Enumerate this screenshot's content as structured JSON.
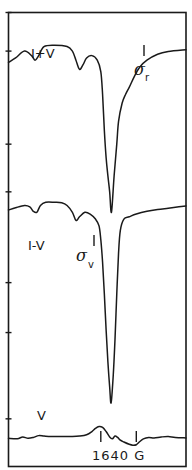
{
  "chart_data": {
    "type": "line",
    "title": "",
    "xlabel": "",
    "ylabel": "",
    "x_range": [
      0,
      100
    ],
    "y_range": [
      0,
      100
    ],
    "grid": false,
    "caption": "1640 G",
    "left_axis_ticks": [
      0,
      8.5,
      29,
      39.5,
      59.5,
      70.5,
      89.5
    ],
    "series": [
      {
        "name": "I+V",
        "label": "I+V",
        "annotation": {
          "symbol": "σ",
          "subscript": "r",
          "marker_x": 70
        },
        "points": [
          [
            0,
            11
          ],
          [
            4,
            10
          ],
          [
            9,
            8.5
          ],
          [
            13,
            9.5
          ],
          [
            15,
            10.5
          ],
          [
            17,
            9.5
          ],
          [
            20,
            7.5
          ],
          [
            26,
            7.2
          ],
          [
            33,
            7.5
          ],
          [
            36,
            8.5
          ],
          [
            38,
            10.5
          ],
          [
            40,
            12.5
          ],
          [
            42,
            11.5
          ],
          [
            44,
            10
          ],
          [
            47,
            9.5
          ],
          [
            50,
            10.5
          ],
          [
            52,
            13
          ],
          [
            53,
            18
          ],
          [
            54,
            26
          ],
          [
            55,
            32
          ],
          [
            56,
            36
          ],
          [
            57,
            39.5
          ],
          [
            58,
            44
          ],
          [
            59.5,
            36
          ],
          [
            61,
            29
          ],
          [
            62,
            24
          ],
          [
            64,
            20
          ],
          [
            66,
            18
          ],
          [
            68,
            16.5
          ],
          [
            71,
            14
          ],
          [
            74,
            12
          ],
          [
            78,
            10.5
          ],
          [
            84,
            9.2
          ],
          [
            90,
            8.6
          ],
          [
            100,
            8.2
          ]
        ]
      },
      {
        "name": "I-V",
        "label": "I-V",
        "annotation": {
          "symbol": "σ",
          "subscript": "v",
          "marker_x": 53
        },
        "points": [
          [
            0,
            43.5
          ],
          [
            4,
            43
          ],
          [
            9,
            42.5
          ],
          [
            12,
            42.8
          ],
          [
            14,
            43.8
          ],
          [
            16,
            44
          ],
          [
            18,
            42.5
          ],
          [
            21,
            41.8
          ],
          [
            26,
            41.8
          ],
          [
            30,
            41.9
          ],
          [
            33,
            42.5
          ],
          [
            36,
            44
          ],
          [
            38,
            45.8
          ],
          [
            40,
            45
          ],
          [
            43,
            44
          ],
          [
            46,
            44.4
          ],
          [
            49,
            45.5
          ],
          [
            51,
            47
          ],
          [
            52,
            50
          ],
          [
            53,
            55
          ],
          [
            54,
            62
          ],
          [
            55,
            70
          ],
          [
            56,
            77
          ],
          [
            57,
            82.5
          ],
          [
            57.8,
            86
          ],
          [
            59,
            80
          ],
          [
            60,
            72
          ],
          [
            61,
            62
          ],
          [
            62,
            53
          ],
          [
            63,
            48
          ],
          [
            65,
            45.5
          ],
          [
            68,
            45
          ],
          [
            72,
            44.4
          ],
          [
            78,
            43.8
          ],
          [
            84,
            43.4
          ],
          [
            90,
            43.1
          ],
          [
            96,
            42.8
          ],
          [
            100,
            42.6
          ]
        ]
      },
      {
        "name": "V",
        "label": "V",
        "annotation": {
          "bars_x": [
            52,
            72
          ]
        },
        "points": [
          [
            0,
            93.8
          ],
          [
            5,
            93.9
          ],
          [
            8,
            93.5
          ],
          [
            11,
            93.8
          ],
          [
            14,
            93.6
          ],
          [
            17,
            93.2
          ],
          [
            20,
            93.3
          ],
          [
            24,
            93.4
          ],
          [
            30,
            93.4
          ],
          [
            36,
            93.4
          ],
          [
            40,
            93.3
          ],
          [
            44,
            93.0
          ],
          [
            47,
            92.3
          ],
          [
            49,
            91.6
          ],
          [
            51,
            91.2
          ],
          [
            53,
            91.4
          ],
          [
            55,
            92.3
          ],
          [
            57,
            93.5
          ],
          [
            58.5,
            93.9
          ],
          [
            60,
            93.3
          ],
          [
            61.5,
            93.6
          ],
          [
            63,
            94.2
          ],
          [
            65,
            94.6
          ],
          [
            68,
            95.1
          ],
          [
            70,
            95.3
          ],
          [
            72,
            95.2
          ],
          [
            74,
            94.5
          ],
          [
            76,
            93.9
          ],
          [
            79,
            93.6
          ],
          [
            82,
            93.7
          ],
          [
            86,
            93.5
          ],
          [
            90,
            93.4
          ],
          [
            94,
            93.6
          ],
          [
            100,
            93.7
          ]
        ]
      }
    ]
  }
}
